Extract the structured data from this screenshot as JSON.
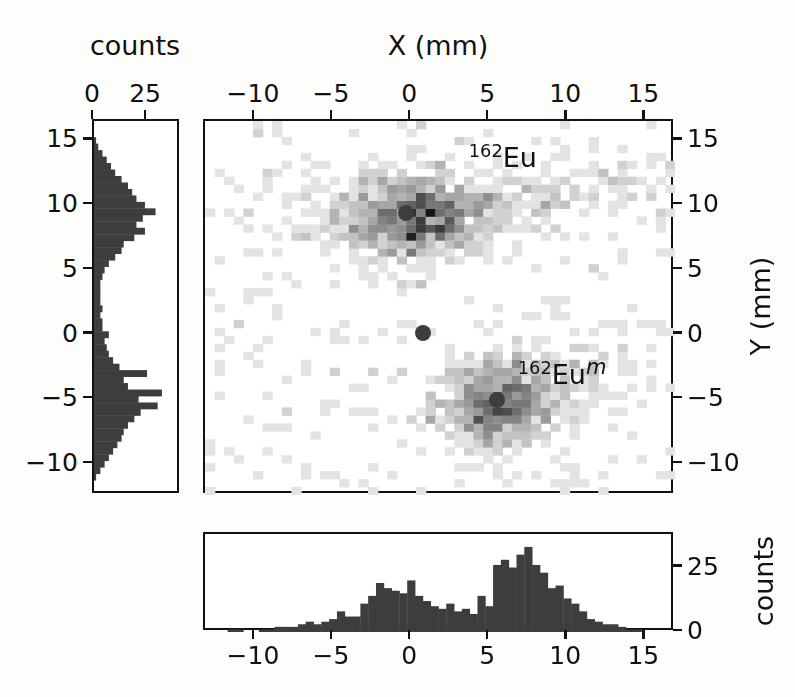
{
  "figure": {
    "background_color": "#fdfdfc",
    "ink_color": "#111111",
    "marker_color": "#3d3d3d"
  },
  "main_panel": {
    "x_axis_title": "X (mm)",
    "x_axis_title_position": "top",
    "y_axis_title": "Y (mm)",
    "y_axis_title_position": "right",
    "x_ticks": [
      -10,
      -5,
      0,
      5,
      10,
      15
    ],
    "x_ticklabels": [
      "−10",
      "−5",
      "0",
      "5",
      "10",
      "15"
    ],
    "y_ticks": [
      15,
      10,
      5,
      0,
      -5,
      -10
    ],
    "y_ticklabels": [
      "15",
      "10",
      "5",
      "0",
      "−5",
      "−10"
    ],
    "xlim": [
      -13.2,
      16.9
    ],
    "ylim": [
      -12.4,
      16.5
    ],
    "annotations": [
      {
        "name": "eu162-ground-state-label",
        "isotope_mass": "162",
        "element": "Eu",
        "state": "",
        "x": 6.0,
        "y": 13.6
      },
      {
        "name": "eu162-isomer-label",
        "isotope_mass": "162",
        "element": "Eu",
        "state": "m",
        "x": 9.8,
        "y": -3.2
      }
    ],
    "markers": [
      {
        "name": "centroid-eu162",
        "x": -0.2,
        "y": 9.2,
        "radius_px": 8
      },
      {
        "name": "centroid-origin",
        "x": 0.9,
        "y": 0.0,
        "radius_px": 8
      },
      {
        "name": "centroid-eu162m",
        "x": 5.6,
        "y": -5.2,
        "radius_px": 8
      }
    ]
  },
  "left_panel": {
    "axis_title": "counts",
    "axis_title_position": "top",
    "x_ticks": [
      0,
      25
    ],
    "x_ticklabels": [
      "0",
      "25"
    ],
    "y_ticks": [
      15,
      10,
      5,
      0,
      -5,
      -10
    ],
    "y_ticklabels": [
      "15",
      "10",
      "5",
      "0",
      "−5",
      "−10"
    ],
    "xlim": [
      0,
      41
    ],
    "ylim": [
      -12.4,
      16.5
    ]
  },
  "bottom_panel": {
    "axis_title": "counts",
    "axis_title_position": "right",
    "x_ticks": [
      -10,
      -5,
      0,
      5,
      10,
      15
    ],
    "x_ticklabels": [
      "−10",
      "−5",
      "0",
      "5",
      "10",
      "15"
    ],
    "y_ticks": [
      0,
      25
    ],
    "y_ticklabels": [
      "0",
      "25"
    ],
    "xlim": [
      -13.2,
      16.9
    ],
    "ylim": [
      0,
      38
    ]
  },
  "chart_data": {
    "type": "heatmap",
    "title": "",
    "xlabel": "X (mm)",
    "ylabel": "Y (mm)",
    "xlim": [
      -13.2,
      16.9
    ],
    "ylim": [
      -12.4,
      16.5
    ],
    "grid": false,
    "legend": "none",
    "colormap": "greys",
    "bin_size_mm": 0.62,
    "blobs": [
      {
        "name": "162Eu",
        "center_x": -0.2,
        "center_y": 9.2,
        "sigma_x": 2.6,
        "sigma_y": 1.7,
        "peak_counts": 9,
        "tail_direction_deg": 10,
        "tail_strength": 0.55
      },
      {
        "name": "162Eum",
        "center_x": 5.6,
        "center_y": -5.2,
        "sigma_x": 1.9,
        "sigma_y": 1.9,
        "peak_counts": 9,
        "tail_direction_deg": 25,
        "tail_strength": 0.35
      }
    ],
    "background_counts_level": 0.35,
    "y_projection": {
      "name": "left-histogram",
      "orientation": "horizontal-bars",
      "xlabel": "counts",
      "ylabel": "Y (mm)",
      "xlim": [
        0,
        41
      ],
      "bin_centers": [
        -11.5,
        -11.0,
        -10.5,
        -10.0,
        -9.5,
        -9.0,
        -8.5,
        -8.0,
        -7.5,
        -7.0,
        -6.5,
        -6.0,
        -5.5,
        -5.0,
        -4.5,
        -4.0,
        -3.5,
        -3.0,
        -2.5,
        -2.0,
        -1.5,
        -1.0,
        -0.5,
        0.0,
        0.5,
        1.0,
        1.5,
        2.0,
        2.5,
        3.0,
        3.5,
        4.0,
        4.5,
        5.0,
        5.5,
        6.0,
        6.5,
        7.0,
        7.5,
        8.0,
        8.5,
        9.0,
        9.5,
        10.0,
        10.5,
        11.0,
        11.5,
        12.0,
        12.5,
        13.0,
        13.5,
        14.0,
        14.5,
        15.0
      ],
      "values": [
        0,
        1,
        3,
        5,
        7,
        9,
        11,
        13,
        14,
        16,
        19,
        22,
        30,
        21,
        32,
        16,
        14,
        25,
        12,
        9,
        7,
        6,
        5,
        7,
        4,
        4,
        3,
        4,
        3,
        3,
        3,
        3,
        4,
        5,
        7,
        10,
        13,
        14,
        19,
        24,
        20,
        23,
        29,
        24,
        20,
        18,
        16,
        13,
        10,
        8,
        6,
        4,
        2,
        1
      ]
    },
    "x_projection": {
      "name": "bottom-histogram",
      "orientation": "vertical-bars",
      "xlabel": "X (mm)",
      "ylabel": "counts",
      "ylim": [
        0,
        38
      ],
      "bin_centers": [
        -12.5,
        -12.0,
        -11.5,
        -11.0,
        -10.5,
        -10.0,
        -9.5,
        -9.0,
        -8.5,
        -8.0,
        -7.5,
        -7.0,
        -6.5,
        -6.0,
        -5.5,
        -5.0,
        -4.5,
        -4.0,
        -3.5,
        -3.0,
        -2.5,
        -2.0,
        -1.5,
        -1.0,
        -0.5,
        0.0,
        0.5,
        1.0,
        1.5,
        2.0,
        2.5,
        3.0,
        3.5,
        4.0,
        4.5,
        5.0,
        5.5,
        6.0,
        6.5,
        7.0,
        7.5,
        8.0,
        8.5,
        9.0,
        9.5,
        10.0,
        10.5,
        11.0,
        11.5,
        12.0,
        12.5,
        13.0,
        13.5,
        14.0,
        14.5,
        15.0,
        15.5,
        16.0
      ],
      "values": [
        0,
        0,
        1,
        1,
        0,
        0,
        1,
        1,
        2,
        2,
        2,
        3,
        4,
        3,
        4,
        5,
        8,
        6,
        6,
        11,
        14,
        19,
        17,
        16,
        15,
        20,
        14,
        12,
        10,
        9,
        11,
        8,
        9,
        7,
        14,
        10,
        26,
        28,
        25,
        30,
        33,
        26,
        23,
        17,
        18,
        13,
        11,
        8,
        5,
        4,
        3,
        3,
        2,
        1,
        1,
        0,
        0,
        0
      ]
    }
  }
}
